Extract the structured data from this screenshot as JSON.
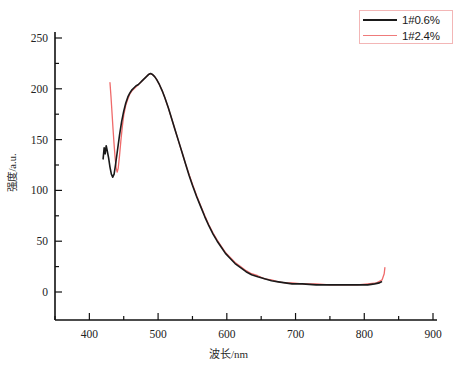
{
  "chart_data": {
    "type": "line",
    "title": "",
    "xlabel": "波长/nm",
    "ylabel": "强度/a.u.",
    "xlim": [
      350,
      900
    ],
    "ylim": [
      0,
      250
    ],
    "xticks": [
      350,
      400,
      450,
      500,
      550,
      600,
      650,
      700,
      750,
      800,
      850,
      900
    ],
    "xticklabels": [
      "",
      "400",
      "",
      "500",
      "",
      "600",
      "",
      "700",
      "",
      "800",
      "",
      "900"
    ],
    "xtick_major": [
      400,
      500,
      600,
      700,
      800,
      900
    ],
    "yticks": [
      0,
      25,
      50,
      75,
      100,
      125,
      150,
      175,
      200,
      225,
      250
    ],
    "yticklabels": [
      "0",
      "",
      "50",
      "",
      "100",
      "",
      "150",
      "",
      "200",
      "",
      "250"
    ],
    "ytick_major": [
      0,
      50,
      100,
      150,
      200,
      250
    ],
    "grid": false,
    "legend_position": "top-right",
    "legend_border_color": "#f3b6b6",
    "series": [
      {
        "name": "1#0.6%",
        "color": "#1a1a1a",
        "width": 1.6,
        "points": [
          [
            420,
            131
          ],
          [
            421.5,
            142
          ],
          [
            423,
            136
          ],
          [
            424.5,
            144
          ],
          [
            426,
            139
          ],
          [
            428,
            132
          ],
          [
            430,
            123
          ],
          [
            432,
            116
          ],
          [
            434,
            113
          ],
          [
            436,
            116
          ],
          [
            438,
            125
          ],
          [
            441,
            140
          ],
          [
            444,
            155
          ],
          [
            447,
            168
          ],
          [
            450,
            178
          ],
          [
            453,
            186
          ],
          [
            456,
            192
          ],
          [
            459,
            196
          ],
          [
            462,
            199
          ],
          [
            465,
            201
          ],
          [
            468,
            203
          ],
          [
            471,
            204
          ],
          [
            474,
            206
          ],
          [
            477,
            208
          ],
          [
            480,
            210
          ],
          [
            483,
            212
          ],
          [
            486,
            214
          ],
          [
            489,
            215
          ],
          [
            492,
            214
          ],
          [
            495,
            212
          ],
          [
            498,
            209
          ],
          [
            502,
            204
          ],
          [
            506,
            198
          ],
          [
            510,
            191
          ],
          [
            515,
            181
          ],
          [
            520,
            170
          ],
          [
            525,
            159
          ],
          [
            530,
            148
          ],
          [
            535,
            137
          ],
          [
            540,
            126
          ],
          [
            545,
            115
          ],
          [
            550,
            105
          ],
          [
            556,
            94
          ],
          [
            562,
            84
          ],
          [
            568,
            74
          ],
          [
            574,
            65
          ],
          [
            580,
            57
          ],
          [
            586,
            50
          ],
          [
            592,
            44
          ],
          [
            598,
            38
          ],
          [
            605,
            33
          ],
          [
            612,
            28
          ],
          [
            620,
            24
          ],
          [
            628,
            20
          ],
          [
            636,
            17
          ],
          [
            645,
            15
          ],
          [
            655,
            13
          ],
          [
            665,
            11
          ],
          [
            675,
            10
          ],
          [
            685,
            9
          ],
          [
            695,
            8
          ],
          [
            710,
            8
          ],
          [
            730,
            7
          ],
          [
            750,
            7
          ],
          [
            770,
            7
          ],
          [
            790,
            7
          ],
          [
            805,
            7
          ],
          [
            815,
            8
          ],
          [
            822,
            9
          ],
          [
            825,
            10
          ]
        ]
      },
      {
        "name": "1#2.4%",
        "color": "#ef6a6a",
        "width": 1.3,
        "points": [
          [
            430,
            206
          ],
          [
            431.5,
            192
          ],
          [
            433,
            176
          ],
          [
            434.5,
            160
          ],
          [
            436,
            145
          ],
          [
            437.5,
            132
          ],
          [
            439,
            122
          ],
          [
            440.5,
            118
          ],
          [
            442,
            122
          ],
          [
            444,
            135
          ],
          [
            446,
            150
          ],
          [
            448,
            163
          ],
          [
            450,
            174
          ],
          [
            453,
            184
          ],
          [
            456,
            190
          ],
          [
            459,
            195
          ],
          [
            462,
            198
          ],
          [
            465,
            200
          ],
          [
            468,
            202
          ],
          [
            471,
            204
          ],
          [
            474,
            206
          ],
          [
            477,
            208
          ],
          [
            480,
            210
          ],
          [
            483,
            212
          ],
          [
            486,
            214
          ],
          [
            489,
            215
          ],
          [
            492,
            214
          ],
          [
            495,
            212
          ],
          [
            498,
            209
          ],
          [
            502,
            204
          ],
          [
            506,
            198
          ],
          [
            510,
            191
          ],
          [
            515,
            181
          ],
          [
            520,
            170
          ],
          [
            525,
            159
          ],
          [
            530,
            148
          ],
          [
            535,
            137
          ],
          [
            540,
            126
          ],
          [
            545,
            116
          ],
          [
            550,
            106
          ],
          [
            556,
            95
          ],
          [
            562,
            85
          ],
          [
            568,
            75
          ],
          [
            574,
            66
          ],
          [
            580,
            58
          ],
          [
            586,
            51
          ],
          [
            592,
            45
          ],
          [
            598,
            39
          ],
          [
            605,
            34
          ],
          [
            612,
            29
          ],
          [
            620,
            25
          ],
          [
            628,
            21
          ],
          [
            636,
            18
          ],
          [
            645,
            16
          ],
          [
            655,
            13
          ],
          [
            665,
            12
          ],
          [
            675,
            10
          ],
          [
            685,
            9
          ],
          [
            695,
            9
          ],
          [
            710,
            8
          ],
          [
            730,
            8
          ],
          [
            750,
            7
          ],
          [
            770,
            7
          ],
          [
            790,
            7
          ],
          [
            805,
            8
          ],
          [
            818,
            9
          ],
          [
            826,
            12
          ],
          [
            829,
            18
          ],
          [
            830,
            24
          ]
        ]
      }
    ]
  },
  "legend": {
    "items": [
      {
        "label": "1#0.6%",
        "color": "#1a1a1a",
        "style": "black"
      },
      {
        "label": "1#2.4%",
        "color": "#ef6a6a",
        "style": "red"
      }
    ]
  },
  "axes": {
    "x_title": "波长/nm",
    "y_title": "强度/a.u."
  }
}
